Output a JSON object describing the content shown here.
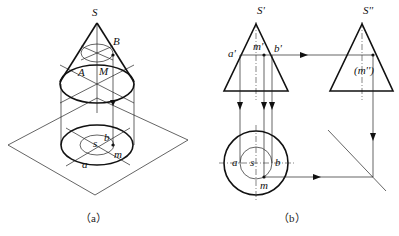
{
  "figure": {
    "panel_a": {
      "caption": "（a）",
      "labels": {
        "apex": "S",
        "point_B": "B",
        "point_A": "A",
        "point_M": "M",
        "proj_s": "s",
        "proj_b": "b",
        "proj_m": "m",
        "proj_a": "a"
      }
    },
    "panel_b": {
      "caption": "（b）",
      "front_view": {
        "apex": "S'",
        "point_a": "a'",
        "point_m": "m'",
        "point_b": "b'"
      },
      "side_view": {
        "apex": "S''",
        "point_m": "(m'')"
      },
      "top_view": {
        "point_a": "a",
        "point_s": "s",
        "point_b": "b",
        "point_m": "m"
      }
    }
  }
}
